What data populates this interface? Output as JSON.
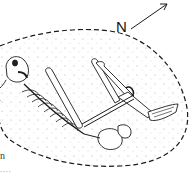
{
  "figure": {
    "type": "archaeological burial plan",
    "north_arrow": {
      "label": "N",
      "direction": "north-east"
    },
    "grave_outline": {
      "style": "dashed",
      "fill": "stippled"
    },
    "caption_fragment": {
      "letter": "n",
      "dots": "...."
    },
    "colors": {
      "ink": "#1a1a1a",
      "background": "#ffffff",
      "stipple": "#9a9a9a"
    }
  }
}
